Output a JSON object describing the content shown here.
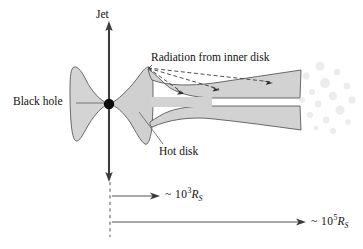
{
  "figure": {
    "background_color": "#ffffff"
  },
  "labels": {
    "jet": "Jet",
    "radiation": "Radiation from inner disk",
    "black_hole": "Black hole",
    "hot_disk": "Hot disk",
    "scale_inner_prefix": "~ 10",
    "scale_inner_exponent": "3",
    "scale_inner_unit": "R",
    "scale_inner_unit_sub": "S",
    "scale_outer_prefix": "~ 10",
    "scale_outer_exponent": "5",
    "scale_outer_unit": "R",
    "scale_outer_unit_sub": "S"
  },
  "colors": {
    "ink": "#111111",
    "outline": "#4a4a4a",
    "disk_fill": "#d0d0d0",
    "disk_fill_light": "#dcdcdc",
    "cloud_fill": "#ececec",
    "leader": "#6b6b6b",
    "jet_line": "#3c3c3c",
    "dashed": "#3c3c3c",
    "background": "#ffffff"
  },
  "geometry": {
    "black_hole": {
      "cx": 109,
      "cy": 104,
      "r": 5.2
    },
    "jet_axis_x": 109,
    "jet_top_y": 22,
    "jet_bottom_y": 181,
    "dashed_reference_x": 110,
    "dashed_reference_y_top": 182,
    "dashed_reference_y_bottom": 237,
    "scale_inner_arrow": {
      "x1": 112,
      "x2": 158,
      "y": 196
    },
    "scale_outer_arrow": {
      "x1": 112,
      "x2": 305,
      "y": 222
    }
  },
  "radiation_rays": [
    {
      "from_x": 148,
      "from_y": 68,
      "to_x": 181,
      "to_y": 92
    },
    {
      "from_x": 148,
      "from_y": 68,
      "to_x": 216,
      "to_y": 88
    },
    {
      "from_x": 148,
      "from_y": 68,
      "to_x": 270,
      "to_y": 81
    }
  ],
  "gas_clouds": [
    {
      "cx": 320,
      "cy": 66,
      "r": 4.5
    },
    {
      "cx": 337,
      "cy": 72,
      "r": 3.2
    },
    {
      "cx": 306,
      "cy": 76,
      "r": 3.6
    },
    {
      "cx": 325,
      "cy": 83,
      "r": 5.0
    },
    {
      "cx": 347,
      "cy": 86,
      "r": 3.4
    },
    {
      "cx": 312,
      "cy": 92,
      "r": 3.0
    },
    {
      "cx": 333,
      "cy": 96,
      "r": 4.2
    },
    {
      "cx": 352,
      "cy": 100,
      "r": 3.6
    },
    {
      "cx": 318,
      "cy": 104,
      "r": 3.4
    },
    {
      "cx": 302,
      "cy": 100,
      "r": 2.8
    },
    {
      "cx": 340,
      "cy": 110,
      "r": 4.6
    },
    {
      "cx": 310,
      "cy": 115,
      "r": 3.0
    },
    {
      "cx": 326,
      "cy": 120,
      "r": 3.4
    },
    {
      "cx": 348,
      "cy": 122,
      "r": 2.8
    },
    {
      "cx": 333,
      "cy": 131,
      "r": 3.0
    },
    {
      "cx": 316,
      "cy": 128,
      "r": 2.2
    }
  ]
}
